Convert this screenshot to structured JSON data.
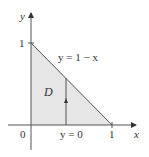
{
  "diagram": {
    "type": "region-diagram",
    "region_label": "D",
    "curve_label": "y = 1 − x",
    "bottom_label": "y = 0",
    "axes": {
      "x_label": "x",
      "y_label": "y",
      "origin_label": "0",
      "x_tick_label": "1",
      "y_tick_label": "1"
    },
    "colors": {
      "region_fill": "#e6e6e6",
      "lines": "#555555"
    }
  }
}
